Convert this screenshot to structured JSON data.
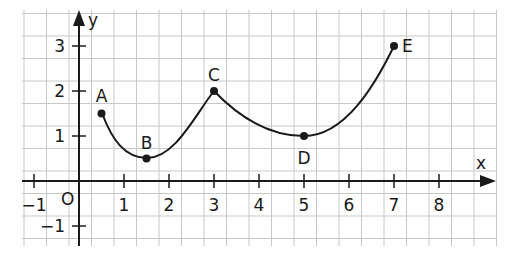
{
  "chart_data": {
    "type": "line",
    "title": "",
    "xlabel": "x",
    "ylabel": "y",
    "origin_label": "O",
    "xlim": [
      -1.2,
      9.3
    ],
    "ylim": [
      -1.4,
      3.8
    ],
    "grid": true,
    "grid_step": 0.5,
    "x_ticks": [
      -1,
      1,
      2,
      3,
      4,
      5,
      6,
      7,
      8
    ],
    "x_tick_labels": [
      "−1",
      "1",
      "2",
      "3",
      "4",
      "5",
      "6",
      "7",
      "8"
    ],
    "y_ticks": [
      -1,
      1,
      2,
      3
    ],
    "y_tick_labels": [
      "−1",
      "1",
      "2",
      "3"
    ],
    "points": [
      {
        "name": "A",
        "x": 0.5,
        "y": 1.5
      },
      {
        "name": "B",
        "x": 1.5,
        "y": 0.5
      },
      {
        "name": "C",
        "x": 3,
        "y": 2
      },
      {
        "name": "D",
        "x": 5,
        "y": 1
      },
      {
        "name": "E",
        "x": 7,
        "y": 3
      }
    ],
    "segments": [
      {
        "from": "A",
        "to": "B",
        "shape": "curve concave up"
      },
      {
        "from": "B",
        "to": "C",
        "shape": "curve"
      },
      {
        "from": "C",
        "to": "D",
        "shape": "curve concave up"
      },
      {
        "from": "D",
        "to": "E",
        "shape": "curve concave up"
      }
    ],
    "colors": {
      "grid": "#c8c8c8",
      "axis": "#1a1a1a",
      "curve": "#1a1a1a"
    }
  }
}
